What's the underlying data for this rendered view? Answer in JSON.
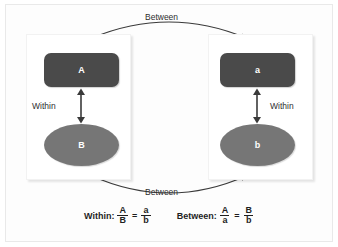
{
  "figure": {
    "name": "within-between-ratio-diagram",
    "colors": {
      "rectangle_fill": "#4a4a4a",
      "ellipse_fill": "#767676",
      "node_text": "#ffffff",
      "arrow": "#3a3a3a",
      "panel_background": "#ffffff",
      "frame_border": "#e9e9e9"
    }
  },
  "panels": {
    "left": {
      "rect_label": "A",
      "ellipse_label": "B",
      "within_label": "Within"
    },
    "right": {
      "rect_label": "a",
      "ellipse_label": "b",
      "within_label": "Within"
    }
  },
  "arcs": {
    "top_label": "Between",
    "bottom_label": "Between"
  },
  "formulas": [
    {
      "name": "within-formula",
      "word": "Within:",
      "left_numerator": "A",
      "left_denominator": "B",
      "equals": "=",
      "right_numerator": "a",
      "right_denominator": "b"
    },
    {
      "name": "between-formula",
      "word": "Between:",
      "left_numerator": "A",
      "left_denominator": "a",
      "equals": "=",
      "right_numerator": "B",
      "right_denominator": "b"
    }
  ]
}
